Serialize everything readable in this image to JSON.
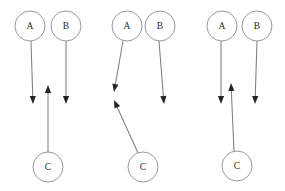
{
  "figure": {
    "background_color": "#ffffff",
    "node_stroke_color": "#8d8d8d",
    "edge_color": "#7f7f7f",
    "arrowhead_color": "#242424",
    "label_color": "#2b2b2b",
    "node_radius": 15
  },
  "panels": [
    {
      "id": "panel-1",
      "nodes": [
        {
          "id": "A",
          "label": "A",
          "cx": 30,
          "cy": 26
        },
        {
          "id": "B",
          "label": "B",
          "cx": 66,
          "cy": 26
        },
        {
          "id": "C",
          "label": "C",
          "cx": 48,
          "cy": 167
        }
      ],
      "edges": [
        {
          "id": "A-down",
          "from": "A",
          "x1": 31,
          "y1": 41,
          "x2": 33,
          "y2": 104,
          "arrow": "end"
        },
        {
          "id": "B-down",
          "from": "B",
          "x1": 66,
          "y1": 41,
          "x2": 66,
          "y2": 104,
          "arrow": "end"
        },
        {
          "id": "C-up",
          "from": "C",
          "x1": 48,
          "y1": 152,
          "x2": 48,
          "y2": 85,
          "arrow": "end"
        }
      ]
    },
    {
      "id": "panel-2",
      "nodes": [
        {
          "id": "A",
          "label": "A",
          "cx": 127,
          "cy": 26
        },
        {
          "id": "B",
          "label": "B",
          "cx": 160,
          "cy": 26
        },
        {
          "id": "C",
          "label": "C",
          "cx": 143,
          "cy": 167
        }
      ],
      "edges": [
        {
          "id": "A-down",
          "from": "A",
          "x1": 123,
          "y1": 41,
          "x2": 114,
          "y2": 92,
          "arrow": "end"
        },
        {
          "id": "B-down",
          "from": "B",
          "x1": 159,
          "y1": 41,
          "x2": 164,
          "y2": 104,
          "arrow": "end"
        },
        {
          "id": "C-up",
          "from": "C",
          "x1": 138,
          "y1": 153,
          "x2": 114,
          "y2": 100,
          "arrow": "end"
        }
      ]
    },
    {
      "id": "panel-3",
      "nodes": [
        {
          "id": "A",
          "label": "A",
          "cx": 222,
          "cy": 26
        },
        {
          "id": "B",
          "label": "B",
          "cx": 257,
          "cy": 26
        },
        {
          "id": "C",
          "label": "C",
          "cx": 237,
          "cy": 166
        }
      ],
      "edges": [
        {
          "id": "A-down",
          "from": "A",
          "x1": 221,
          "y1": 41,
          "x2": 221,
          "y2": 104,
          "arrow": "end"
        },
        {
          "id": "B-down",
          "from": "B",
          "x1": 257,
          "y1": 41,
          "x2": 255,
          "y2": 104,
          "arrow": "end"
        },
        {
          "id": "C-up",
          "from": "C",
          "x1": 234,
          "y1": 151,
          "x2": 231,
          "y2": 83,
          "arrow": "end"
        }
      ]
    }
  ]
}
